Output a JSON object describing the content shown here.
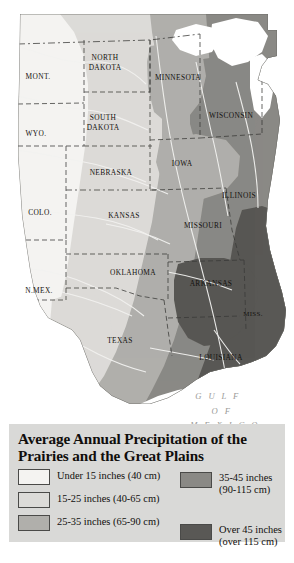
{
  "title": {
    "line1": "Average Annual Precipitation of the",
    "line2": "Prairies and the Great Plains",
    "full": "Average Annual Precipitation of the Prairies and the Great Plains"
  },
  "legend": {
    "left_items": [
      {
        "label": "Under 15 inches (40 cm)",
        "color": "#f4f3f1",
        "range_in": "under 15",
        "range_cm": "40"
      },
      {
        "label": "15-25 inches (40-65 cm)",
        "color": "#dcdbd8",
        "range_in": "15-25",
        "range_cm": "40-65"
      },
      {
        "label": "25-35 inches (65-90 cm)",
        "color": "#b0afab",
        "range_in": "25-35",
        "range_cm": "65-90"
      }
    ],
    "right_items": [
      {
        "label": "35-45 inches\n(90-115 cm)",
        "color": "#8a8985",
        "range_in": "35-45",
        "range_cm": "90-115"
      },
      {
        "label": "Over 45 inches\n(over 115 cm)",
        "color": "#595855",
        "range_in": "over 45",
        "range_cm": "over 115"
      }
    ],
    "panel_color": "#d9d9d7"
  },
  "map": {
    "ocean_color": "#ffffff",
    "background_color": "#ffffff",
    "border_color": "#3a3a38",
    "river_color": "#f2f2f0",
    "states": [
      {
        "name": "MONT.",
        "x": 38,
        "y": 76
      },
      {
        "name": "NORTH\nDAKOTA",
        "x": 105,
        "y": 62,
        "line1": "NORTH",
        "line2": "DAKOTA"
      },
      {
        "name": "MINNESOTA",
        "x": 178,
        "y": 77
      },
      {
        "name": "WYO.",
        "x": 36,
        "y": 133
      },
      {
        "name": "SOUTH\nDAKOTA",
        "x": 103,
        "y": 122,
        "line1": "SOUTH",
        "line2": "DAKOTA"
      },
      {
        "name": "WISCONSIN",
        "x": 231,
        "y": 115
      },
      {
        "name": "NEBRASKA",
        "x": 111,
        "y": 172
      },
      {
        "name": "IOWA",
        "x": 182,
        "y": 163
      },
      {
        "name": "ILLINOIS",
        "x": 239,
        "y": 195
      },
      {
        "name": "COLO.",
        "x": 40,
        "y": 212
      },
      {
        "name": "KANSAS",
        "x": 124,
        "y": 215
      },
      {
        "name": "MISSOURI",
        "x": 203,
        "y": 225
      },
      {
        "name": "N.MEX.",
        "x": 39,
        "y": 290
      },
      {
        "name": "OKLAHOMA",
        "x": 133,
        "y": 272
      },
      {
        "name": "ARKANSAS",
        "x": 211,
        "y": 283
      },
      {
        "name": "MISS.",
        "x": 253,
        "y": 313
      },
      {
        "name": "TEXAS",
        "x": 120,
        "y": 340
      },
      {
        "name": "LOUISIANA",
        "x": 221,
        "y": 357
      }
    ],
    "ocean_labels": [
      {
        "text": "G U L F",
        "x": 218,
        "y": 396
      },
      {
        "text": "O F",
        "x": 222,
        "y": 411
      },
      {
        "text": "M E X I C O",
        "x": 225,
        "y": 425
      }
    ]
  }
}
